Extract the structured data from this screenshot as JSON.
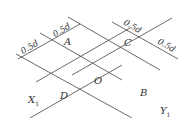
{
  "diagram": {
    "type": "rhombic grid with dimension annotations",
    "points": {
      "A": "A",
      "C": "C",
      "O": "O",
      "B": "B",
      "D": "D"
    },
    "axes": {
      "x1": "X",
      "x1_sub": "1",
      "y1": "Y",
      "y1_sub": "1"
    },
    "dimensions": {
      "d1": "0.5d",
      "d2": "0.5d",
      "d3": "0.5d",
      "d4": "0.5d"
    },
    "line_color": "#444444"
  }
}
